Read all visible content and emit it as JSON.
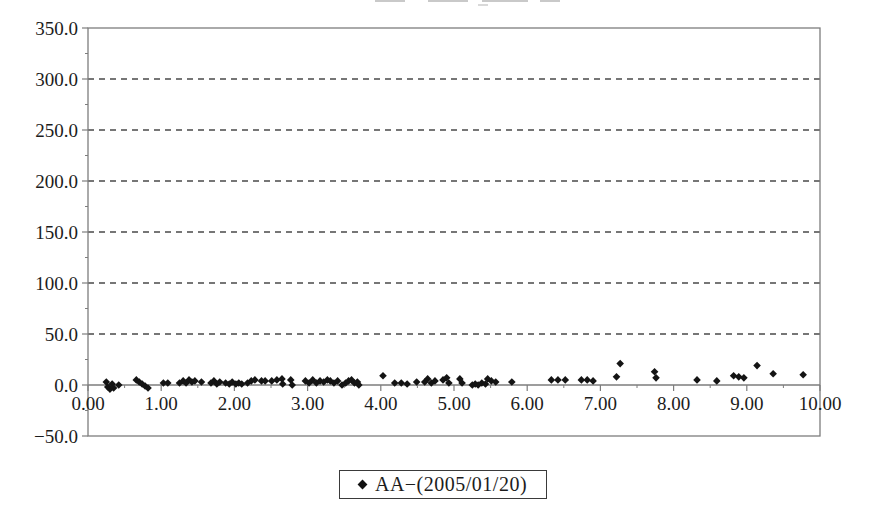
{
  "chart_data": {
    "type": "scatter",
    "title": "",
    "xlabel": "",
    "ylabel": "",
    "xlim": [
      0,
      10
    ],
    "ylim": [
      -50,
      350
    ],
    "x_tick_values": [
      0,
      1,
      2,
      3,
      4,
      5,
      6,
      7,
      8,
      9,
      10
    ],
    "x_tick_labels": [
      "0.00",
      "1.00",
      "2.00",
      "3.00",
      "4.00",
      "5.00",
      "6.00",
      "7.00",
      "8.00",
      "9.00",
      "10.00"
    ],
    "y_tick_values": [
      350,
      300,
      250,
      200,
      150,
      100,
      50,
      0,
      -50
    ],
    "y_tick_labels": [
      "350.0",
      "300.0",
      "250.0",
      "200.0",
      "150.0",
      "100.0",
      "50.0",
      "0.0",
      "−50.0"
    ],
    "gridline_values": [
      300,
      250,
      200,
      150,
      100,
      50
    ],
    "grid_style": "dashed",
    "legend": {
      "position": "bottom",
      "label": "AA−(2005/01/20)",
      "marker": "diamond"
    },
    "colors": {
      "marker": "#141414",
      "grid": "#4a4a4a",
      "frame": "#7d7d7d",
      "axis": "#7d7d7d",
      "text": "#1c1c1c",
      "background": "#ffffff"
    },
    "series": [
      {
        "name": "AA−(2005/01/20)",
        "marker": "diamond",
        "color": "#141414",
        "points": [
          [
            0.25,
            3
          ],
          [
            0.27,
            -2
          ],
          [
            0.3,
            -4
          ],
          [
            0.33,
            1
          ],
          [
            0.35,
            -3
          ],
          [
            0.42,
            0
          ],
          [
            0.66,
            5
          ],
          [
            0.7,
            3
          ],
          [
            0.74,
            1
          ],
          [
            0.78,
            -1
          ],
          [
            0.82,
            -3
          ],
          [
            1.03,
            2
          ],
          [
            1.09,
            2
          ],
          [
            1.25,
            2
          ],
          [
            1.3,
            4
          ],
          [
            1.34,
            2
          ],
          [
            1.38,
            5
          ],
          [
            1.42,
            3
          ],
          [
            1.46,
            4
          ],
          [
            1.55,
            3
          ],
          [
            1.68,
            2
          ],
          [
            1.72,
            4
          ],
          [
            1.76,
            1
          ],
          [
            1.8,
            3
          ],
          [
            1.88,
            2
          ],
          [
            1.93,
            1
          ],
          [
            1.97,
            3
          ],
          [
            2.02,
            1
          ],
          [
            2.06,
            2
          ],
          [
            2.1,
            1
          ],
          [
            2.18,
            2
          ],
          [
            2.23,
            4
          ],
          [
            2.28,
            5
          ],
          [
            2.37,
            4
          ],
          [
            2.42,
            4
          ],
          [
            2.51,
            4
          ],
          [
            2.58,
            5
          ],
          [
            2.65,
            6
          ],
          [
            2.66,
            1
          ],
          [
            2.77,
            5
          ],
          [
            2.79,
            0
          ],
          [
            2.97,
            4
          ],
          [
            3.02,
            2
          ],
          [
            3.07,
            5
          ],
          [
            3.12,
            2
          ],
          [
            3.17,
            4
          ],
          [
            3.22,
            3
          ],
          [
            3.27,
            5
          ],
          [
            3.31,
            4
          ],
          [
            3.36,
            2
          ],
          [
            3.41,
            4
          ],
          [
            3.47,
            0
          ],
          [
            3.52,
            2
          ],
          [
            3.56,
            4
          ],
          [
            3.6,
            5
          ],
          [
            3.64,
            2
          ],
          [
            3.68,
            3
          ],
          [
            3.7,
            0
          ],
          [
            4.03,
            9
          ],
          [
            4.19,
            2
          ],
          [
            4.28,
            2
          ],
          [
            4.36,
            1
          ],
          [
            4.49,
            3
          ],
          [
            4.6,
            3
          ],
          [
            4.64,
            6
          ],
          [
            4.69,
            2
          ],
          [
            4.74,
            4
          ],
          [
            4.85,
            5
          ],
          [
            4.9,
            7
          ],
          [
            4.93,
            2
          ],
          [
            5.08,
            6
          ],
          [
            5.11,
            2
          ],
          [
            5.25,
            0
          ],
          [
            5.29,
            1
          ],
          [
            5.33,
            0
          ],
          [
            5.38,
            2
          ],
          [
            5.43,
            1
          ],
          [
            5.46,
            6
          ],
          [
            5.51,
            4
          ],
          [
            5.57,
            3
          ],
          [
            5.79,
            3
          ],
          [
            6.33,
            5
          ],
          [
            6.42,
            5
          ],
          [
            6.52,
            5
          ],
          [
            6.74,
            5
          ],
          [
            6.82,
            5
          ],
          [
            6.9,
            4
          ],
          [
            7.22,
            8
          ],
          [
            7.27,
            21
          ],
          [
            7.74,
            13
          ],
          [
            7.76,
            7
          ],
          [
            8.32,
            5
          ],
          [
            8.59,
            4
          ],
          [
            8.82,
            9
          ],
          [
            8.89,
            8
          ],
          [
            8.96,
            7
          ],
          [
            9.14,
            19
          ],
          [
            9.36,
            11
          ],
          [
            9.77,
            10
          ]
        ]
      }
    ]
  }
}
